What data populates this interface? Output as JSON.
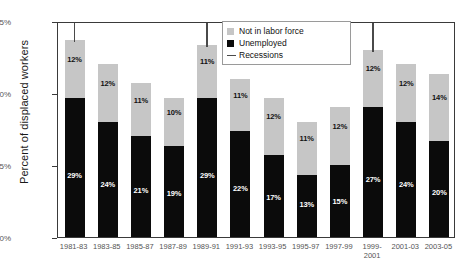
{
  "chart_data": {
    "type": "bar",
    "title": "",
    "xlabel": "",
    "ylabel": "Percent of displaced workers",
    "ylim": [
      0,
      45
    ],
    "yticks": [
      "0%",
      "15%",
      "30%",
      "45%"
    ],
    "ytick_values": [
      0,
      15,
      30,
      45
    ],
    "grid": false,
    "stacked": true,
    "legend_position": "top-right",
    "categories": [
      "1981-83",
      "1983-85",
      "1985-87",
      "1987-89",
      "1989-91",
      "1991-93",
      "1993-95",
      "1995-97",
      "1997-99",
      "1999-2001",
      "2001-03",
      "2003-05"
    ],
    "series": [
      {
        "name": "Unemployed",
        "color": "#0b0b0b",
        "values": [
          29,
          24,
          21,
          19,
          29,
          22,
          17,
          13,
          15,
          27,
          24,
          20
        ],
        "labels": [
          "29%",
          "24%",
          "21%",
          "19%",
          "29%",
          "22%",
          "17%",
          "13%",
          "15%",
          "27%",
          "24%",
          "20%"
        ]
      },
      {
        "name": "Not in labor force",
        "color": "#c6c6c6",
        "values": [
          12,
          12,
          11,
          10,
          11,
          11,
          12,
          11,
          12,
          12,
          12,
          14
        ],
        "labels": [
          "12%",
          "12%",
          "11%",
          "10%",
          "11%",
          "11%",
          "12%",
          "11%",
          "12%",
          "12%",
          "12%",
          "14%"
        ]
      }
    ],
    "totals": [
      41,
      36,
      32,
      29,
      40,
      33,
      29,
      24,
      27,
      39,
      36,
      34
    ],
    "annotations": {
      "recessions": {
        "label": "Recessions",
        "color": "#4a4a4a",
        "at_categories": [
          "1981-83",
          "1989-91",
          "1999-2001"
        ]
      }
    },
    "legend": [
      {
        "label": "Not in labor force",
        "swatch": "gray-square"
      },
      {
        "label": "Unemployed",
        "swatch": "black-square"
      },
      {
        "label": "Recessions",
        "swatch": "line"
      }
    ]
  }
}
